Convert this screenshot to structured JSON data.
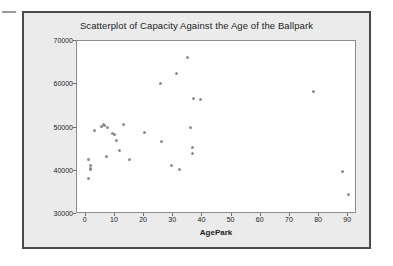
{
  "figure": {
    "title": "Scatterplot of Capacity Against the Age of the Ballpark",
    "background_color": "#ebebeb",
    "plot_background_color": "#ffffff",
    "border_color": "#4a4a4a",
    "point_color": "#8e8e8e"
  },
  "chart_data": {
    "type": "scatter",
    "title": "Scatterplot of Capacity Against the Age of the Ballpark",
    "xlabel": "AgePark",
    "ylabel": "Capacity",
    "xlim": [
      -3,
      93
    ],
    "ylim": [
      30000,
      70000
    ],
    "xticks": [
      0,
      10,
      20,
      30,
      40,
      50,
      60,
      70,
      80,
      90
    ],
    "xtick_labels": [
      "0",
      "10",
      "20",
      "30",
      "40",
      "50",
      "60",
      "70",
      "80",
      "90"
    ],
    "yticks": [
      30000,
      40000,
      50000,
      60000,
      70000
    ],
    "ytick_labels": [
      "30000",
      "40000",
      "50000",
      "60000",
      "70000"
    ],
    "grid": false,
    "legend": false,
    "marker": "circle",
    "points": [
      {
        "x": 1,
        "y": 42500
      },
      {
        "x": 1.5,
        "y": 41100
      },
      {
        "x": 1.5,
        "y": 40600
      },
      {
        "x": 1.5,
        "y": 40200
      },
      {
        "x": 1,
        "y": 38200
      },
      {
        "x": 3,
        "y": 49200
      },
      {
        "x": 5.5,
        "y": 50200
      },
      {
        "x": 6,
        "y": 50600
      },
      {
        "x": 6.5,
        "y": 50500
      },
      {
        "x": 7.5,
        "y": 49900
      },
      {
        "x": 7,
        "y": 43300
      },
      {
        "x": 9,
        "y": 48700
      },
      {
        "x": 10,
        "y": 48400
      },
      {
        "x": 10.5,
        "y": 47100
      },
      {
        "x": 11.5,
        "y": 44600
      },
      {
        "x": 13,
        "y": 50600
      },
      {
        "x": 15,
        "y": 42700
      },
      {
        "x": 20,
        "y": 48900
      },
      {
        "x": 25.5,
        "y": 60200
      },
      {
        "x": 26,
        "y": 46800
      },
      {
        "x": 29.5,
        "y": 41100
      },
      {
        "x": 31,
        "y": 62400
      },
      {
        "x": 32,
        "y": 40400
      },
      {
        "x": 35,
        "y": 66200
      },
      {
        "x": 36,
        "y": 50000
      },
      {
        "x": 36.5,
        "y": 45300
      },
      {
        "x": 36.5,
        "y": 44100
      },
      {
        "x": 37,
        "y": 56700
      },
      {
        "x": 39.5,
        "y": 56400
      },
      {
        "x": 78,
        "y": 58400
      },
      {
        "x": 88,
        "y": 39800
      },
      {
        "x": 90,
        "y": 34500
      }
    ]
  }
}
